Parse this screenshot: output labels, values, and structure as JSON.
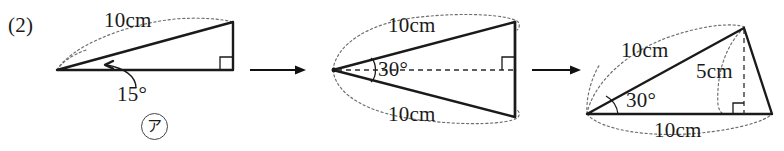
{
  "exercise": {
    "number": "(2)",
    "marker": "ア"
  },
  "figures": [
    {
      "id": "figure-1",
      "name": "right-triangle-15-degrees",
      "labels": {
        "hypotenuse": "10cm",
        "angle": "15°"
      }
    },
    {
      "id": "figure-2",
      "name": "mirrored-double-triangle-30-degrees",
      "labels": {
        "upper_side": "10cm",
        "lower_side": "10cm",
        "angle": "30°"
      }
    },
    {
      "id": "figure-3",
      "name": "triangle-with-altitude",
      "labels": {
        "slant_side": "10cm",
        "altitude": "5cm",
        "base": "10cm",
        "angle": "30°"
      }
    }
  ],
  "arrows": [
    {
      "name": "transform-arrow-1"
    },
    {
      "name": "transform-arrow-2"
    }
  ],
  "colors": {
    "ink": "#1a1a1a",
    "construction": "#6d6d6d",
    "background": "#ffffff"
  }
}
